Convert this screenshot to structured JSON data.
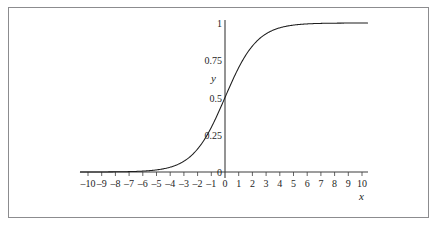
{
  "chart_data": {
    "type": "line",
    "title": "",
    "subtitle": "",
    "xlabel": "x",
    "ylabel": "y",
    "xlim": [
      -10.8,
      10.8
    ],
    "ylim": [
      -0.06,
      1.06
    ],
    "grid": false,
    "legend": null,
    "function": "logistic: y = 1 / (1 + e^(-0.85x))",
    "xticks": [
      -10,
      -9,
      -8,
      -7,
      -6,
      -5,
      -4,
      -3,
      -2,
      -1,
      0,
      1,
      2,
      3,
      4,
      5,
      6,
      7,
      8,
      9,
      10
    ],
    "xtick_labels": [
      "–10",
      "–9",
      "–8",
      "–7",
      "–6",
      "–5",
      "–4",
      "–3",
      "–2",
      "–1",
      "0",
      "1",
      "2",
      "3",
      "4",
      "5",
      "6",
      "7",
      "8",
      "9",
      "10"
    ],
    "yticks": [
      0,
      0.25,
      0.5,
      0.75,
      1
    ],
    "ytick_labels": [
      "0",
      "0.25",
      "0.5",
      "0.75",
      "1"
    ],
    "series": [
      {
        "name": "logistic curve",
        "x": [
          -10,
          -9.5,
          -9,
          -8.5,
          -8,
          -7.5,
          -7,
          -6.5,
          -6,
          -5.5,
          -5,
          -4.5,
          -4,
          -3.5,
          -3,
          -2.5,
          -2,
          -1.5,
          -1,
          -0.5,
          0,
          0.5,
          1,
          1.5,
          2,
          2.5,
          3,
          3.5,
          4,
          4.5,
          5,
          5.5,
          6,
          6.5,
          7,
          7.5,
          8,
          8.5,
          9,
          9.5,
          10
        ],
        "y": [
          0.0002,
          0.0003,
          0.0005,
          0.0007,
          0.0011,
          0.0017,
          0.0026,
          0.0039,
          0.006,
          0.0092,
          0.014,
          0.0212,
          0.0321,
          0.0483,
          0.0723,
          0.1073,
          0.1545,
          0.2186,
          0.2993,
          0.3953,
          0.5,
          0.6047,
          0.7007,
          0.7814,
          0.8455,
          0.8927,
          0.9277,
          0.9517,
          0.9679,
          0.9788,
          0.986,
          0.9908,
          0.994,
          0.9961,
          0.9974,
          0.9983,
          0.9989,
          0.9993,
          0.9995,
          0.9997,
          0.9998
        ]
      }
    ],
    "colors": {
      "curve": "#1d1d1d",
      "axis": "#3c3c3c",
      "frame": "#8c8c8f",
      "text": "#1d1d1d",
      "background": "#ffffff"
    },
    "geometry": {
      "x_axis_y_px": 172,
      "y_axis_x_px": 225,
      "x_left_px": 80,
      "x_right_px": 368,
      "y_top_px": 20,
      "y_one_px": 23,
      "px_per_unit_x": 13.7,
      "px_per_unit_y": 149
    }
  }
}
